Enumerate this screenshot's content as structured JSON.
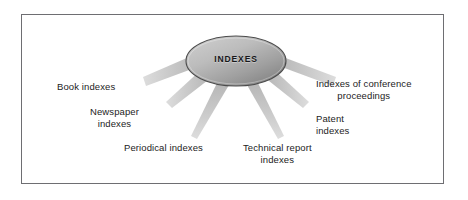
{
  "figure": {
    "type": "radial-spoke-diagram",
    "background_color": "#ffffff",
    "border_color": "#6e6e72",
    "center": {
      "label": "INDEXES",
      "shape": "ellipse",
      "fill_light": "#c2c2c2",
      "fill_dark": "#8a8a8a",
      "outline_color": "#4c4c4c"
    },
    "spoke_color": "#c9c9c9",
    "nodes": [
      {
        "id": "book-indexes",
        "lines": [
          "Book indexes"
        ],
        "align": "left"
      },
      {
        "id": "newspaper-indexes",
        "lines": [
          "Newspaper",
          "indexes"
        ],
        "align": "center"
      },
      {
        "id": "periodical-indexes",
        "lines": [
          "Periodical indexes"
        ],
        "align": "left"
      },
      {
        "id": "technical-report",
        "lines": [
          "Technical report",
          "indexes"
        ],
        "align": "center"
      },
      {
        "id": "patent-indexes",
        "lines": [
          "Patent",
          "indexes"
        ],
        "align": "left"
      },
      {
        "id": "conference-proc",
        "lines": [
          "Indexes of conference",
          "proceedings"
        ],
        "align": "center"
      }
    ]
  },
  "labels": {
    "center": "INDEXES",
    "book_indexes": "Book indexes",
    "newspaper_indexes": "Newspaper\nindexes",
    "periodical_indexes": "Periodical indexes",
    "technical_report_indexes": "Technical report\nindexes",
    "patent_indexes": "Patent\nindexes",
    "conference_proceedings": "Indexes of conference\nproceedings"
  }
}
